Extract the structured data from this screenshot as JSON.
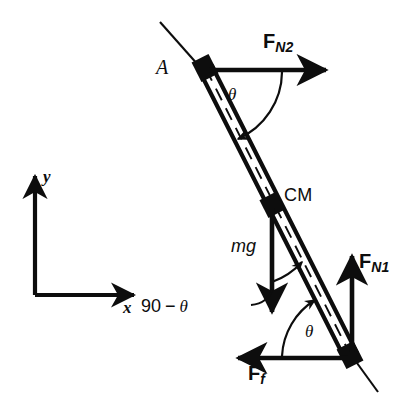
{
  "figure": {
    "background_color": "#ffffff",
    "ink_color": "#0d0d0d",
    "width": 413,
    "height": 411
  },
  "labels": {
    "point_a": "A",
    "center_of_mass": "CM",
    "weight": "mg",
    "normal_top": {
      "symbol": "F",
      "subscript": "N2"
    },
    "normal_bottom": {
      "symbol": "F",
      "subscript": "N1"
    },
    "friction": {
      "symbol": "F",
      "subscript": "f"
    },
    "angle_top": "θ",
    "angle_bottom": "θ",
    "angle_cm": "90 − θ",
    "angle_cm_number": "90",
    "angle_cm_minus": "−",
    "angle_cm_theta": "θ",
    "axis_x": "x",
    "axis_y": "y"
  },
  "geometry": {
    "rod_top_end": [
      205,
      68
    ],
    "rod_bottom_end": [
      350,
      355
    ],
    "center_of_mass_point": [
      272,
      205
    ],
    "extension_top": [
      160,
      22
    ],
    "extension_bottom": [
      378,
      392
    ],
    "axes_origin": [
      35,
      295
    ],
    "axes_y_tip": [
      35,
      170
    ],
    "axes_x_tip": [
      140,
      295
    ],
    "f_n2_tip": [
      330,
      70
    ],
    "f_n1_tip": [
      352,
      250
    ],
    "f_f_tip": [
      232,
      358
    ],
    "mg_tip": [
      272,
      318
    ]
  },
  "annotations": {
    "rod_style": "hollow-beam-with-dashed-centerline",
    "block_markers": [
      "point_a",
      "center_of_mass",
      "bottom_contact"
    ]
  }
}
